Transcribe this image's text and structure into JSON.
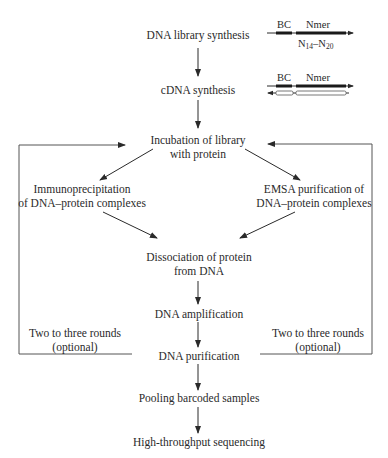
{
  "diagram": {
    "type": "flowchart",
    "steps": {
      "library_synthesis": "DNA library synthesis",
      "cdna_synthesis": "cDNA synthesis",
      "incubation_l1": "Incubation of library",
      "incubation_l2": "with protein",
      "ip_l1": "Immunoprecipitation",
      "ip_l2": "of DNA–protein complexes",
      "emsa_l1": "EMSA purification of",
      "emsa_l2": "DNA–protein complexes",
      "dissociation_l1": "Dissociation of protein",
      "dissociation_l2": "from DNA",
      "amplification": "DNA amplification",
      "purification": "DNA purification",
      "pooling": "Pooling barcoded samples",
      "sequencing": "High-throughput sequencing"
    },
    "loops": {
      "left_l1": "Two to three rounds",
      "left_l2": "(optional)",
      "right_l1": "Two to three rounds",
      "right_l2": "(optional)"
    },
    "schematics": {
      "library": {
        "bc": "BC",
        "nmer": "Nmer",
        "range_n": "N",
        "range_from": "14",
        "range_dash": "–N",
        "range_to": "20"
      },
      "cdna": {
        "bc": "BC",
        "nmer": "Nmer"
      }
    },
    "colors": {
      "line": "#2a2a2a",
      "loop_line": "#555555"
    }
  }
}
